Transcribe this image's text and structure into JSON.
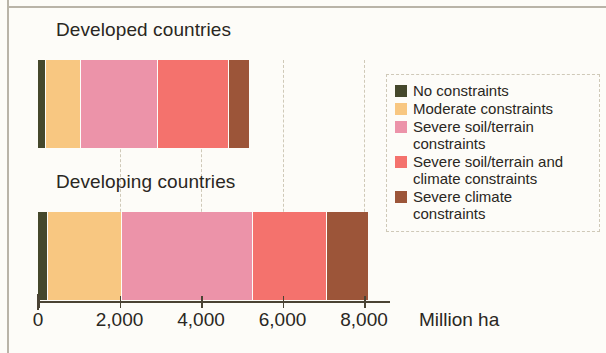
{
  "chart_data": {
    "type": "bar",
    "orientation": "horizontal",
    "stacked": true,
    "title": "",
    "xlabel": "Million ha",
    "ylabel": "",
    "xlim": [
      0,
      8600
    ],
    "xticks": [
      0,
      2000,
      4000,
      6000,
      8000
    ],
    "xtick_labels": [
      "0",
      "2,000",
      "4,000",
      "6,000",
      "8,000"
    ],
    "grid": true,
    "grid_axis": "x",
    "legend_position": "right",
    "categories": [
      "Developed countries",
      "Developing countries"
    ],
    "series": [
      {
        "name": "No constraints",
        "color": "#45482c",
        "values": [
          200,
          250
        ]
      },
      {
        "name": "Moderate constraints",
        "color": "#f8c781",
        "values": [
          860,
          1820
        ]
      },
      {
        "name": "Severe soil/terrain constraints",
        "color": "#ec93a9",
        "values": [
          1890,
          3210
        ]
      },
      {
        "name": "Severe soil/terrain and climate constraints",
        "color": "#f4726d",
        "values": [
          1740,
          1810
        ]
      },
      {
        "name": "Severe climate constraints",
        "color": "#9c5539",
        "values": [
          490,
          1000
        ]
      }
    ],
    "totals": [
      5180,
      8090
    ]
  },
  "groups": [
    {
      "label": "Developed countries"
    },
    {
      "label": "Developing countries"
    }
  ],
  "axis": {
    "unit": "Million ha",
    "ticks": [
      {
        "label": "0"
      },
      {
        "label": "2,000"
      },
      {
        "label": "4,000"
      },
      {
        "label": "6,000"
      },
      {
        "label": "8,000"
      }
    ]
  },
  "legend": {
    "items": [
      {
        "label": "No constraints",
        "color": "#45482c"
      },
      {
        "label": "Moderate constraints",
        "color": "#f8c781"
      },
      {
        "label": "Severe soil/terrain\nconstraints",
        "color": "#ec93a9"
      },
      {
        "label": "Severe soil/terrain and\nclimate constraints",
        "color": "#f4726d"
      },
      {
        "label": "Severe climate\nconstraints",
        "color": "#9c5539"
      }
    ]
  }
}
